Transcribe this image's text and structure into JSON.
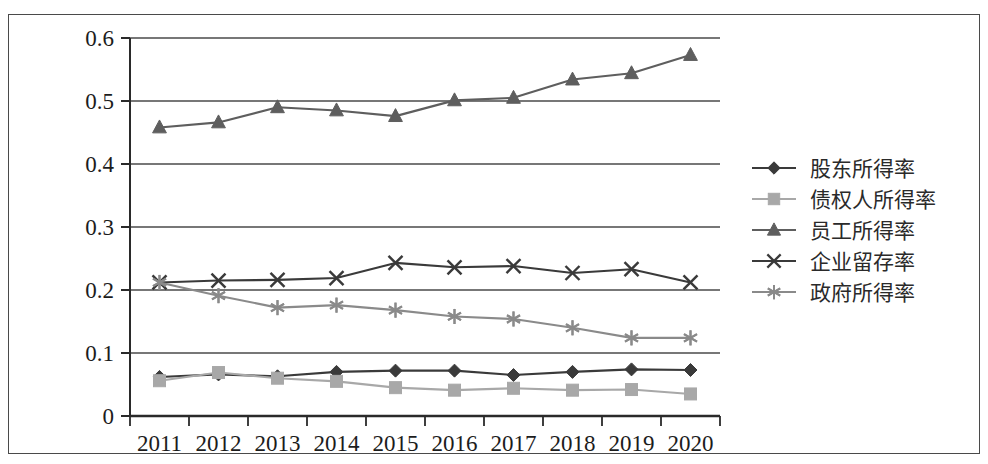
{
  "chart_data": {
    "type": "line",
    "title": "",
    "subtitle": "",
    "xlabel": "",
    "ylabel": "",
    "categories": [
      "2011",
      "2012",
      "2013",
      "2014",
      "2015",
      "2016",
      "2017",
      "2018",
      "2019",
      "2020"
    ],
    "x_tick_labels": [
      "2011",
      "2012",
      "2013",
      "2014",
      "2015",
      "2016",
      "2017",
      "2018",
      "2019",
      "2020"
    ],
    "y_tick_labels": [
      "0",
      "0.1",
      "0.2",
      "0.3",
      "0.4",
      "0.5",
      "0.6"
    ],
    "y_tick_values": [
      0,
      0.1,
      0.2,
      0.3,
      0.4,
      0.5,
      0.6
    ],
    "ylim": [
      0,
      0.6
    ],
    "grid": "horizontal",
    "legend_position": "right",
    "series": [
      {
        "name": "股东所得率",
        "marker": "diamond",
        "color": "#3a3a3a",
        "values": [
          0.062,
          0.066,
          0.063,
          0.07,
          0.072,
          0.072,
          0.065,
          0.07,
          0.074,
          0.073
        ]
      },
      {
        "name": "债权人所得率",
        "marker": "square",
        "color": "#a8a8a8",
        "values": [
          0.056,
          0.069,
          0.06,
          0.055,
          0.045,
          0.041,
          0.044,
          0.041,
          0.042,
          0.035
        ]
      },
      {
        "name": "员工所得率",
        "marker": "triangle",
        "color": "#5e5e5e",
        "values": [
          0.458,
          0.466,
          0.49,
          0.485,
          0.476,
          0.501,
          0.505,
          0.534,
          0.544,
          0.573
        ]
      },
      {
        "name": "企业留存率",
        "marker": "x",
        "color": "#3a3a3a",
        "values": [
          0.212,
          0.215,
          0.216,
          0.219,
          0.243,
          0.236,
          0.238,
          0.227,
          0.233,
          0.212
        ]
      },
      {
        "name": "政府所得率",
        "marker": "asterisk",
        "color": "#8a8a8a",
        "values": [
          0.212,
          0.191,
          0.172,
          0.176,
          0.168,
          0.158,
          0.154,
          0.14,
          0.124,
          0.124
        ]
      }
    ]
  },
  "legend": {
    "items": [
      {
        "label": "股东所得率",
        "marker": "diamond",
        "color": "#3a3a3a"
      },
      {
        "label": "债权人所得率",
        "marker": "square",
        "color": "#a8a8a8"
      },
      {
        "label": "员工所得率",
        "marker": "triangle",
        "color": "#5e5e5e"
      },
      {
        "label": "企业留存率",
        "marker": "x",
        "color": "#3a3a3a"
      },
      {
        "label": "政府所得率",
        "marker": "asterisk",
        "color": "#8a8a8a"
      }
    ]
  },
  "axes": {
    "axis_line_color": "#2a2a2a",
    "grid_color": "#4a4a4a"
  }
}
